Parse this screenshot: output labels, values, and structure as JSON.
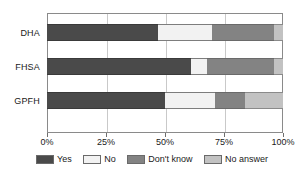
{
  "chart_data": {
    "type": "bar",
    "orientation": "horizontal",
    "stacked": true,
    "normalized": true,
    "title": "",
    "xlabel": "",
    "ylabel": "",
    "categories": [
      "DHA",
      "FHSA",
      "GPFH"
    ],
    "xlim": [
      0,
      100
    ],
    "xticks": [
      0,
      25,
      50,
      75,
      100
    ],
    "xticklabels": [
      "0%",
      "25%",
      "50%",
      "75%",
      "100%"
    ],
    "grid": true,
    "legend_position": "bottom",
    "series": [
      {
        "name": "Yes",
        "color": "#4a4a4a",
        "values": [
          47,
          61,
          50
        ]
      },
      {
        "name": "No",
        "color": "#f2f2f2",
        "values": [
          23,
          7,
          21
        ]
      },
      {
        "name": "Don't know",
        "color": "#838383",
        "values": [
          26,
          28,
          13
        ]
      },
      {
        "name": "No answer",
        "color": "#c2c2c2",
        "values": [
          4,
          4,
          16
        ]
      }
    ]
  },
  "axis": {
    "ticks": [
      {
        "label": "0%",
        "value": 0
      },
      {
        "label": "25%",
        "value": 25
      },
      {
        "label": "50%",
        "value": 50
      },
      {
        "label": "75%",
        "value": 75
      },
      {
        "label": "100%",
        "value": 100
      }
    ]
  },
  "legend": {
    "items": [
      {
        "label": "Yes",
        "color": "#4a4a4a"
      },
      {
        "label": "No",
        "color": "#f2f2f2"
      },
      {
        "label": "Don't know",
        "color": "#838383"
      },
      {
        "label": "No answer",
        "color": "#c2c2c2"
      }
    ]
  }
}
